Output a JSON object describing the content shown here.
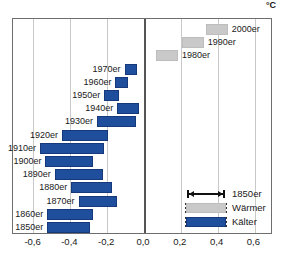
{
  "chart_data": {
    "type": "bar",
    "orientation": "horizontal",
    "title": "",
    "xlabel": "°C",
    "ylabel": "",
    "xlim": [
      -0.7,
      0.7
    ],
    "xticks": [
      "-0,6",
      "-0,4",
      "-0,2",
      "0,0",
      "0,2",
      "0,4",
      "0,6"
    ],
    "xtick_values": [
      -0.6,
      -0.4,
      -0.2,
      0.0,
      0.2,
      0.4,
      0.6
    ],
    "unit": "°C",
    "grid": true,
    "zero_axis": 0.0,
    "legend_position": "bottom-right",
    "categories": [
      "1850er",
      "1860er",
      "1870er",
      "1880er",
      "1890er",
      "1900er",
      "1910er",
      "1920er",
      "1930er",
      "1940er",
      "1950er",
      "1960er",
      "1970er",
      "1980er",
      "1990er",
      "2000er"
    ],
    "bars": [
      {
        "label": "2000er",
        "start": 0.34,
        "end": 0.46,
        "kind": "warm",
        "label_side": "right"
      },
      {
        "label": "1990er",
        "start": 0.21,
        "end": 0.33,
        "kind": "warm",
        "label_side": "right"
      },
      {
        "label": "1980er",
        "start": 0.07,
        "end": 0.19,
        "kind": "warm",
        "label_side": "right"
      },
      {
        "label": "1970er",
        "start": -0.1,
        "end": -0.03,
        "kind": "cold",
        "label_side": "left"
      },
      {
        "label": "1960er",
        "start": -0.15,
        "end": -0.08,
        "kind": "cold",
        "label_side": "left"
      },
      {
        "label": "1950er",
        "start": -0.21,
        "end": -0.13,
        "kind": "cold",
        "label_side": "left"
      },
      {
        "label": "1940er",
        "start": -0.14,
        "end": -0.02,
        "kind": "cold",
        "label_side": "left"
      },
      {
        "label": "1930er",
        "start": -0.25,
        "end": -0.04,
        "kind": "cold",
        "label_side": "left"
      },
      {
        "label": "1920er",
        "start": -0.44,
        "end": -0.19,
        "kind": "cold",
        "label_side": "left"
      },
      {
        "label": "1910er",
        "start": -0.56,
        "end": -0.21,
        "kind": "cold",
        "label_side": "left"
      },
      {
        "label": "1900er",
        "start": -0.53,
        "end": -0.27,
        "kind": "cold",
        "label_side": "left"
      },
      {
        "label": "1890er",
        "start": -0.48,
        "end": -0.22,
        "kind": "cold",
        "label_side": "left"
      },
      {
        "label": "1880er",
        "start": -0.39,
        "end": -0.17,
        "kind": "cold",
        "label_side": "left"
      },
      {
        "label": "1870er",
        "start": -0.35,
        "end": -0.14,
        "kind": "cold",
        "label_side": "left"
      },
      {
        "label": "1860er",
        "start": -0.52,
        "end": -0.27,
        "kind": "cold",
        "label_side": "left"
      },
      {
        "label": "1850er",
        "start": -0.52,
        "end": -0.29,
        "kind": "cold",
        "label_side": "left"
      }
    ],
    "legend": [
      {
        "label": "1850er",
        "kind": "span"
      },
      {
        "label": "Wärmer",
        "kind": "warm"
      },
      {
        "label": "Kälter",
        "kind": "cold"
      }
    ],
    "colors": {
      "cold": "#1f4e9c",
      "warm": "#c9c9c9",
      "grid": "#c9c9c9",
      "frame": "#6e6e6e",
      "zero_axis": "#555555",
      "text": "#1a1a1a"
    }
  }
}
